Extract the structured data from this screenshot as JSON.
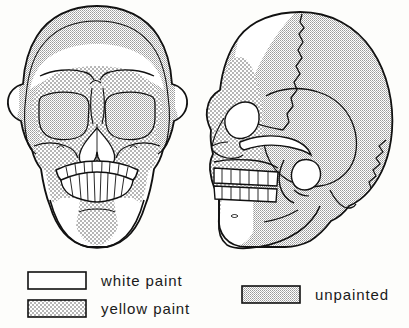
{
  "figure": {
    "views": [
      {
        "name": "frontal-skull",
        "label": "anterior view of human skull"
      },
      {
        "name": "lateral-skull",
        "label": "right lateral view of human skull"
      }
    ]
  },
  "legend": {
    "items": [
      {
        "key": "white",
        "label": "white paint",
        "swatch": "white-swatch",
        "fill": "#ffffff"
      },
      {
        "key": "yellow",
        "label": "yellow paint",
        "swatch": "dotted-swatch",
        "fill": "#ffffff"
      },
      {
        "key": "unpainted",
        "label": "unpainted",
        "swatch": "stippled-swatch",
        "fill": "#d8d8d8"
      }
    ]
  },
  "colors": {
    "ink": "#111111",
    "unpainted_gray": "#d6d6d6",
    "paper": "#fdfdfb"
  }
}
